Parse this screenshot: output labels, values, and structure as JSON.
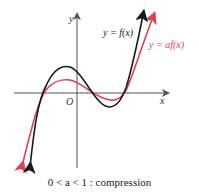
{
  "diagram": {
    "axes": {
      "x_label": "x",
      "y_label": "y",
      "origin_label": "O"
    },
    "curves": [
      {
        "name": "original",
        "label": "y = f(x)",
        "color": "#1a1a1a"
      },
      {
        "name": "transformed",
        "label": "y = af(x)",
        "color": "#e0404f"
      }
    ],
    "caption": "0 < a < 1 : compression"
  }
}
